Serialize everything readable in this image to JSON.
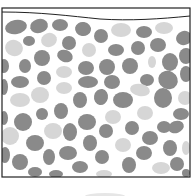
{
  "diagram": {
    "colors": {
      "background": "#ffffff",
      "frame": "#222222",
      "dark_pebble": "#8a8a8a",
      "light_pebble": "#d6d6d6",
      "shadow": "#e6e6e6"
    },
    "frame": {
      "x": 2,
      "y": 8,
      "width": 188,
      "height": 169
    },
    "surface_path": "M2,12 C40,12 70,16 100,19 C130,21 160,19 190,16",
    "pebbles": [
      {
        "cx": 16,
        "cy": 27,
        "rx": 11,
        "ry": 7,
        "rot": -10,
        "shade": "dark"
      },
      {
        "cx": 39,
        "cy": 26,
        "rx": 9,
        "ry": 7,
        "rot": -15,
        "shade": "dark"
      },
      {
        "cx": 60,
        "cy": 25,
        "rx": 8,
        "ry": 6,
        "rot": 0,
        "shade": "dark"
      },
      {
        "cx": 83,
        "cy": 29,
        "rx": 8,
        "ry": 7,
        "rot": 10,
        "shade": "dark"
      },
      {
        "cx": 101,
        "cy": 36,
        "rx": 7,
        "ry": 7,
        "rot": 0,
        "shade": "dark"
      },
      {
        "cx": 121,
        "cy": 30,
        "rx": 10,
        "ry": 7,
        "rot": 0,
        "shade": "light"
      },
      {
        "cx": 144,
        "cy": 32,
        "rx": 8,
        "ry": 6,
        "rot": 0,
        "shade": "dark"
      },
      {
        "cx": 164,
        "cy": 28,
        "rx": 9,
        "ry": 6,
        "rot": 0,
        "shade": "light"
      },
      {
        "cx": 184,
        "cy": 38,
        "rx": 8,
        "ry": 7,
        "rot": -20,
        "shade": "dark"
      },
      {
        "cx": 14,
        "cy": 48,
        "rx": 9,
        "ry": 8,
        "rot": 20,
        "shade": "light"
      },
      {
        "cx": 29,
        "cy": 41,
        "rx": 6,
        "ry": 5,
        "rot": 0,
        "shade": "dark"
      },
      {
        "cx": 49,
        "cy": 40,
        "rx": 8,
        "ry": 7,
        "rot": -20,
        "shade": "light"
      },
      {
        "cx": 69,
        "cy": 43,
        "rx": 7,
        "ry": 7,
        "rot": 0,
        "shade": "dark"
      },
      {
        "cx": 89,
        "cy": 50,
        "rx": 7,
        "ry": 7,
        "rot": 0,
        "shade": "light"
      },
      {
        "cx": 116,
        "cy": 50,
        "rx": 8,
        "ry": 6,
        "rot": 0,
        "shade": "dark"
      },
      {
        "cx": 138,
        "cy": 48,
        "rx": 7,
        "ry": 7,
        "rot": 0,
        "shade": "dark"
      },
      {
        "cx": 158,
        "cy": 45,
        "rx": 8,
        "ry": 7,
        "rot": 0,
        "shade": "dark"
      },
      {
        "cx": 186,
        "cy": 56,
        "rx": 7,
        "ry": 8,
        "rot": 0,
        "shade": "dark"
      },
      {
        "cx": 4,
        "cy": 66,
        "rx": 5,
        "ry": 7,
        "rot": 0,
        "shade": "dark"
      },
      {
        "cx": 25,
        "cy": 66,
        "rx": 6,
        "ry": 7,
        "rot": 0,
        "shade": "dark"
      },
      {
        "cx": 42,
        "cy": 58,
        "rx": 8,
        "ry": 8,
        "rot": 0,
        "shade": "dark"
      },
      {
        "cx": 65,
        "cy": 56,
        "rx": 8,
        "ry": 6,
        "rot": 20,
        "shade": "dark"
      },
      {
        "cx": 86,
        "cy": 68,
        "rx": 8,
        "ry": 7,
        "rot": 0,
        "shade": "dark"
      },
      {
        "cx": 107,
        "cy": 67,
        "rx": 8,
        "ry": 8,
        "rot": 0,
        "shade": "dark"
      },
      {
        "cx": 130,
        "cy": 66,
        "rx": 8,
        "ry": 8,
        "rot": 0,
        "shade": "dark"
      },
      {
        "cx": 152,
        "cy": 62,
        "rx": 4,
        "ry": 6,
        "rot": 0,
        "shade": "light"
      },
      {
        "cx": 170,
        "cy": 62,
        "rx": 8,
        "ry": 9,
        "rot": 0,
        "shade": "dark"
      },
      {
        "cx": 186,
        "cy": 74,
        "rx": 6,
        "ry": 8,
        "rot": 0,
        "shade": "dark"
      },
      {
        "cx": 20,
        "cy": 82,
        "rx": 9,
        "ry": 6,
        "rot": 0,
        "shade": "dark"
      },
      {
        "cx": 44,
        "cy": 78,
        "rx": 7,
        "ry": 7,
        "rot": 0,
        "shade": "dark"
      },
      {
        "cx": 64,
        "cy": 72,
        "rx": 8,
        "ry": 6,
        "rot": 0,
        "shade": "light"
      },
      {
        "cx": 88,
        "cy": 82,
        "rx": 10,
        "ry": 6,
        "rot": 0,
        "shade": "dark"
      },
      {
        "cx": 112,
        "cy": 82,
        "rx": 8,
        "ry": 7,
        "rot": 0,
        "shade": "dark"
      },
      {
        "cx": 147,
        "cy": 80,
        "rx": 7,
        "ry": 6,
        "rot": 0,
        "shade": "dark"
      },
      {
        "cx": 168,
        "cy": 80,
        "rx": 10,
        "ry": 9,
        "rot": 30,
        "shade": "dark"
      },
      {
        "cx": 4,
        "cy": 87,
        "rx": 4,
        "ry": 8,
        "rot": 0,
        "shade": "dark"
      },
      {
        "cx": 40,
        "cy": 95,
        "rx": 9,
        "ry": 8,
        "rot": 0,
        "shade": "light"
      },
      {
        "cx": 64,
        "cy": 88,
        "rx": 8,
        "ry": 6,
        "rot": 0,
        "shade": "light"
      },
      {
        "cx": 20,
        "cy": 100,
        "rx": 10,
        "ry": 7,
        "rot": 0,
        "shade": "light"
      },
      {
        "cx": 80,
        "cy": 100,
        "rx": 7,
        "ry": 8,
        "rot": 0,
        "shade": "dark"
      },
      {
        "cx": 101,
        "cy": 97,
        "rx": 7,
        "ry": 8,
        "rot": 10,
        "shade": "dark"
      },
      {
        "cx": 123,
        "cy": 100,
        "rx": 10,
        "ry": 8,
        "rot": 0,
        "shade": "dark"
      },
      {
        "cx": 140,
        "cy": 90,
        "rx": 10,
        "ry": 6,
        "rot": 10,
        "shade": "light"
      },
      {
        "cx": 163,
        "cy": 98,
        "rx": 9,
        "ry": 10,
        "rot": 0,
        "shade": "dark"
      },
      {
        "cx": 185,
        "cy": 98,
        "rx": 7,
        "ry": 7,
        "rot": 0,
        "shade": "light"
      },
      {
        "cx": 4,
        "cy": 118,
        "rx": 4,
        "ry": 7,
        "rot": 0,
        "shade": "dark"
      },
      {
        "cx": 23,
        "cy": 122,
        "rx": 9,
        "ry": 9,
        "rot": 0,
        "shade": "dark"
      },
      {
        "cx": 42,
        "cy": 114,
        "rx": 6,
        "ry": 6,
        "rot": 0,
        "shade": "dark"
      },
      {
        "cx": 61,
        "cy": 111,
        "rx": 7,
        "ry": 8,
        "rot": 0,
        "shade": "dark"
      },
      {
        "cx": 87,
        "cy": 122,
        "rx": 9,
        "ry": 8,
        "rot": 0,
        "shade": "dark"
      },
      {
        "cx": 113,
        "cy": 117,
        "rx": 8,
        "ry": 7,
        "rot": 0,
        "shade": "light"
      },
      {
        "cx": 145,
        "cy": 113,
        "rx": 8,
        "ry": 7,
        "rot": 0,
        "shade": "light"
      },
      {
        "cx": 181,
        "cy": 114,
        "rx": 8,
        "ry": 6,
        "rot": 0,
        "shade": "dark"
      },
      {
        "cx": 10,
        "cy": 136,
        "rx": 9,
        "ry": 9,
        "rot": 0,
        "shade": "light"
      },
      {
        "cx": 53,
        "cy": 131,
        "rx": 9,
        "ry": 8,
        "rot": 0,
        "shade": "light"
      },
      {
        "cx": 70,
        "cy": 132,
        "rx": 7,
        "ry": 9,
        "rot": 0,
        "shade": "dark"
      },
      {
        "cx": 106,
        "cy": 131,
        "rx": 7,
        "ry": 7,
        "rot": 0,
        "shade": "dark"
      },
      {
        "cx": 132,
        "cy": 128,
        "rx": 7,
        "ry": 7,
        "rot": 0,
        "shade": "dark"
      },
      {
        "cx": 164,
        "cy": 127,
        "rx": 7,
        "ry": 6,
        "rot": 0,
        "shade": "dark"
      },
      {
        "cx": 176,
        "cy": 127,
        "rx": 8,
        "ry": 6,
        "rot": -20,
        "shade": "dark"
      },
      {
        "cx": 35,
        "cy": 143,
        "rx": 9,
        "ry": 8,
        "rot": 0,
        "shade": "dark"
      },
      {
        "cx": 68,
        "cy": 153,
        "rx": 9,
        "ry": 7,
        "rot": 0,
        "shade": "dark"
      },
      {
        "cx": 90,
        "cy": 143,
        "rx": 7,
        "ry": 8,
        "rot": 0,
        "shade": "dark"
      },
      {
        "cx": 123,
        "cy": 145,
        "rx": 8,
        "ry": 7,
        "rot": 0,
        "shade": "light"
      },
      {
        "cx": 150,
        "cy": 138,
        "rx": 8,
        "ry": 7,
        "rot": 0,
        "shade": "dark"
      },
      {
        "cx": 170,
        "cy": 148,
        "rx": 7,
        "ry": 8,
        "rot": 0,
        "shade": "dark"
      },
      {
        "cx": 186,
        "cy": 148,
        "rx": 4,
        "ry": 7,
        "rot": 0,
        "shade": "light"
      },
      {
        "cx": 5,
        "cy": 155,
        "rx": 5,
        "ry": 8,
        "rot": 0,
        "shade": "dark"
      },
      {
        "cx": 20,
        "cy": 162,
        "rx": 8,
        "ry": 8,
        "rot": 0,
        "shade": "dark"
      },
      {
        "cx": 49,
        "cy": 157,
        "rx": 6,
        "ry": 8,
        "rot": 0,
        "shade": "dark"
      },
      {
        "cx": 80,
        "cy": 167,
        "rx": 8,
        "ry": 6,
        "rot": 0,
        "shade": "dark"
      },
      {
        "cx": 102,
        "cy": 157,
        "rx": 7,
        "ry": 7,
        "rot": 0,
        "shade": "dark"
      },
      {
        "cx": 129,
        "cy": 165,
        "rx": 7,
        "ry": 8,
        "rot": 0,
        "shade": "dark"
      },
      {
        "cx": 144,
        "cy": 153,
        "rx": 8,
        "ry": 7,
        "rot": 0,
        "shade": "dark"
      },
      {
        "cx": 161,
        "cy": 168,
        "rx": 9,
        "ry": 6,
        "rot": 0,
        "shade": "light"
      },
      {
        "cx": 177,
        "cy": 164,
        "rx": 7,
        "ry": 7,
        "rot": 0,
        "shade": "dark"
      },
      {
        "cx": 35,
        "cy": 172,
        "rx": 7,
        "ry": 5,
        "rot": 0,
        "shade": "dark"
      },
      {
        "cx": 56,
        "cy": 174,
        "rx": 7,
        "ry": 4,
        "rot": 0,
        "shade": "dark"
      },
      {
        "cx": 104,
        "cy": 174,
        "rx": 8,
        "ry": 4,
        "rot": 0,
        "shade": "light"
      },
      {
        "cx": 186,
        "cy": 173,
        "rx": 4,
        "ry": 4,
        "rot": 0,
        "shade": "dark"
      }
    ],
    "bottom_shadow": {
      "cx": 105,
      "cy": 196,
      "rx": 20,
      "ry": 3
    }
  }
}
